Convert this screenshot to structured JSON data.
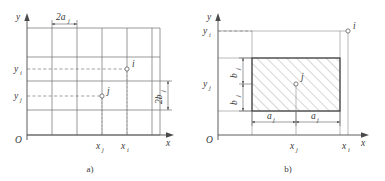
{
  "figure": {
    "background_color": "#ffffff",
    "line_color": "#4a4a4a",
    "grid_color": "#6e6e6e",
    "hatch_color": "#8a8a8a"
  },
  "panel_a": {
    "caption": "a)",
    "axis_x_label": "x",
    "axis_y_label": "y",
    "origin_label": "O",
    "y_tick_labels": [
      "y",
      "y"
    ],
    "y_tick_subscripts": [
      "i",
      "j"
    ],
    "x_tick_labels": [
      "x",
      "x"
    ],
    "x_tick_subscripts": [
      "j",
      "i"
    ],
    "dim_top_label": "2a",
    "dim_top_subscript": "j",
    "dim_right_label": "2b",
    "dim_right_subscript": "j",
    "point_i_label": "i",
    "point_j_label": "j",
    "grid_columns": 6,
    "grid_rows": 5
  },
  "panel_b": {
    "caption": "b)",
    "axis_x_label": "x",
    "axis_y_label": "y",
    "origin_label": "O",
    "y_tick_labels": [
      "y",
      "y"
    ],
    "y_tick_subscripts": [
      "i",
      "j"
    ],
    "x_tick_labels": [
      "x",
      "x"
    ],
    "x_tick_subscripts": [
      "j",
      "i"
    ],
    "dim_left_upper_label": "b",
    "dim_left_upper_subscript": "j",
    "dim_left_lower_label": "b",
    "dim_left_lower_subscript": "j",
    "dim_bottom_left_label": "a",
    "dim_bottom_left_subscript": "j",
    "dim_bottom_right_label": "a",
    "dim_bottom_right_subscript": "j",
    "point_i_label": "i",
    "point_j_label": "j",
    "hatched": true
  }
}
